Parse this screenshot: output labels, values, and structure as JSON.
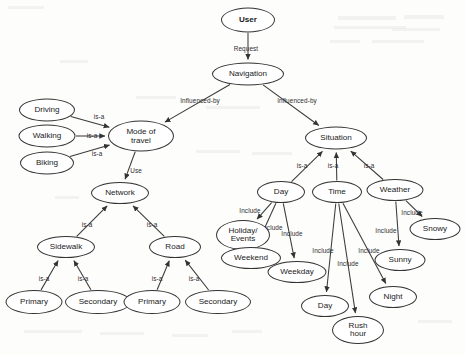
{
  "diagram": {
    "nodes": [
      {
        "id": "user",
        "label": "User",
        "x": 248,
        "y": 20,
        "w": 54,
        "h": 25,
        "bold": true
      },
      {
        "id": "navigation",
        "label": "Navigation",
        "x": 248,
        "y": 74,
        "w": 72,
        "h": 23
      },
      {
        "id": "driving",
        "label": "Driving",
        "x": 47,
        "y": 110,
        "w": 56,
        "h": 23
      },
      {
        "id": "walking",
        "label": "Walking",
        "x": 47,
        "y": 136,
        "w": 57,
        "h": 23
      },
      {
        "id": "biking",
        "label": "Biking",
        "x": 47,
        "y": 163,
        "w": 54,
        "h": 23
      },
      {
        "id": "modeoftravel",
        "label": "Mode of\ntravel",
        "x": 141,
        "y": 136,
        "w": 66,
        "h": 31
      },
      {
        "id": "network",
        "label": "Network",
        "x": 120,
        "y": 193,
        "w": 58,
        "h": 22
      },
      {
        "id": "sidewalk",
        "label": "Sidewalk",
        "x": 66,
        "y": 247,
        "w": 58,
        "h": 22
      },
      {
        "id": "road",
        "label": "Road",
        "x": 175,
        "y": 247,
        "w": 52,
        "h": 22
      },
      {
        "id": "sw-primary",
        "label": "Primary",
        "x": 34,
        "y": 302,
        "w": 57,
        "h": 24
      },
      {
        "id": "sw-secondary",
        "label": "Secondary",
        "x": 98,
        "y": 302,
        "w": 66,
        "h": 24
      },
      {
        "id": "rd-primary",
        "label": "Primary",
        "x": 152,
        "y": 302,
        "w": 57,
        "h": 24
      },
      {
        "id": "rd-secondary",
        "label": "Secondary",
        "x": 218,
        "y": 302,
        "w": 66,
        "h": 24
      },
      {
        "id": "situation",
        "label": "Situation",
        "x": 336,
        "y": 138,
        "w": 62,
        "h": 23
      },
      {
        "id": "day",
        "label": "Day",
        "x": 281,
        "y": 192,
        "w": 48,
        "h": 22
      },
      {
        "id": "time",
        "label": "Time",
        "x": 337,
        "y": 192,
        "w": 50,
        "h": 22
      },
      {
        "id": "weather",
        "label": "Weather",
        "x": 395,
        "y": 190,
        "w": 57,
        "h": 22
      },
      {
        "id": "holiday",
        "label": "Holiday/\nEvents",
        "x": 243,
        "y": 235,
        "w": 54,
        "h": 30
      },
      {
        "id": "weekend",
        "label": "Weekend",
        "x": 251,
        "y": 258,
        "w": 60,
        "h": 22
      },
      {
        "id": "weekday",
        "label": "Weekday",
        "x": 297,
        "y": 272,
        "w": 59,
        "h": 22
      },
      {
        "id": "snowy",
        "label": "Snowy",
        "x": 435,
        "y": 229,
        "w": 51,
        "h": 22
      },
      {
        "id": "sunny",
        "label": "Sunny",
        "x": 400,
        "y": 260,
        "w": 51,
        "h": 22
      },
      {
        "id": "time-day",
        "label": "Day",
        "x": 325,
        "y": 306,
        "w": 48,
        "h": 22
      },
      {
        "id": "night",
        "label": "Night",
        "x": 393,
        "y": 297,
        "w": 48,
        "h": 22
      },
      {
        "id": "rushhour",
        "label": "Rush\nhour",
        "x": 358,
        "y": 330,
        "w": 52,
        "h": 28
      }
    ],
    "edges": [
      {
        "from": "user",
        "to": "navigation",
        "label": "Request",
        "lx": 246,
        "ly": 48
      },
      {
        "from": "navigation",
        "to": "modeoftravel",
        "label": "Influenced-by",
        "lx": 200,
        "ly": 100
      },
      {
        "from": "navigation",
        "to": "situation",
        "label": "Influenced-by",
        "lx": 297,
        "ly": 100
      },
      {
        "from": "driving",
        "to": "modeoftravel",
        "label": "is-a",
        "lx": 99,
        "ly": 116
      },
      {
        "from": "walking",
        "to": "modeoftravel",
        "label": "is-a",
        "lx": 92,
        "ly": 135
      },
      {
        "from": "biking",
        "to": "modeoftravel",
        "label": "is-a",
        "lx": 97,
        "ly": 153
      },
      {
        "from": "modeoftravel",
        "to": "network",
        "label": "Use",
        "lx": 136,
        "ly": 170
      },
      {
        "from": "sidewalk",
        "to": "network",
        "label": "is-a",
        "lx": 87,
        "ly": 224
      },
      {
        "from": "road",
        "to": "network",
        "label": "is-a",
        "lx": 152,
        "ly": 224
      },
      {
        "from": "sw-primary",
        "to": "sidewalk",
        "label": "is-a",
        "lx": 44,
        "ly": 278
      },
      {
        "from": "sw-secondary",
        "to": "sidewalk",
        "label": "is-a",
        "lx": 83,
        "ly": 278
      },
      {
        "from": "rd-primary",
        "to": "road",
        "label": "is-a",
        "lx": 157,
        "ly": 278
      },
      {
        "from": "rd-secondary",
        "to": "road",
        "label": "is-a",
        "lx": 194,
        "ly": 278
      },
      {
        "from": "day",
        "to": "situation",
        "label": "is-a",
        "lx": 302,
        "ly": 165
      },
      {
        "from": "time",
        "to": "situation",
        "label": "is-a",
        "lx": 333,
        "ly": 165
      },
      {
        "from": "weather",
        "to": "situation",
        "label": "is-a",
        "lx": 369,
        "ly": 165
      },
      {
        "from": "day",
        "to": "holiday",
        "label": "Include",
        "lx": 250,
        "ly": 210
      },
      {
        "from": "day",
        "to": "weekend",
        "label": "Include",
        "lx": 272,
        "ly": 227
      },
      {
        "from": "day",
        "to": "weekday",
        "label": "Include",
        "lx": 292,
        "ly": 233
      },
      {
        "from": "time",
        "to": "time-day",
        "label": "Include",
        "lx": 323,
        "ly": 250
      },
      {
        "from": "time",
        "to": "rushhour",
        "label": "Include",
        "lx": 348,
        "ly": 263
      },
      {
        "from": "time",
        "to": "night",
        "label": "Include",
        "lx": 369,
        "ly": 250
      },
      {
        "from": "weather",
        "to": "snowy",
        "label": "Include",
        "lx": 412,
        "ly": 212
      },
      {
        "from": "weather",
        "to": "sunny",
        "label": "Include",
        "lx": 386,
        "ly": 230
      }
    ]
  },
  "artifacts": [
    {
      "x": 8,
      "y": 6,
      "w": 36,
      "h": 3
    },
    {
      "x": 338,
      "y": 16,
      "w": 58,
      "h": 4
    },
    {
      "x": 404,
      "y": 15,
      "w": 40,
      "h": 4
    },
    {
      "x": 334,
      "y": 26,
      "w": 72,
      "h": 3
    },
    {
      "x": 392,
      "y": 28,
      "w": 48,
      "h": 3
    },
    {
      "x": 330,
      "y": 40,
      "w": 30,
      "h": 3
    },
    {
      "x": 372,
      "y": 40,
      "w": 52,
      "h": 3
    },
    {
      "x": 136,
      "y": 96,
      "w": 40,
      "h": 3
    },
    {
      "x": 206,
      "y": 106,
      "w": 54,
      "h": 3
    },
    {
      "x": 55,
      "y": 196,
      "w": 24,
      "h": 3
    },
    {
      "x": 196,
      "y": 150,
      "w": 44,
      "h": 3
    },
    {
      "x": 252,
      "y": 152,
      "w": 40,
      "h": 3
    },
    {
      "x": 24,
      "y": 330,
      "w": 58,
      "h": 3
    },
    {
      "x": 100,
      "y": 332,
      "w": 44,
      "h": 3
    },
    {
      "x": 172,
      "y": 334,
      "w": 36,
      "h": 3
    },
    {
      "x": 232,
      "y": 330,
      "w": 30,
      "h": 3
    },
    {
      "x": 418,
      "y": 320,
      "w": 34,
      "h": 3
    },
    {
      "x": 60,
      "y": 60,
      "w": 28,
      "h": 3
    }
  ]
}
